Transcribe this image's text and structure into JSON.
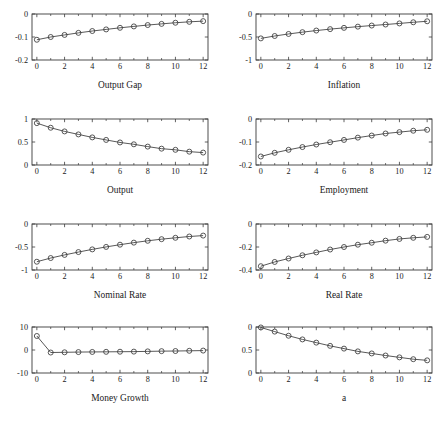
{
  "figure": {
    "rows": 4,
    "cols": 2,
    "background": "#ffffff",
    "line_color": "#3a3a3a",
    "marker": "circle"
  },
  "chart_data": [
    {
      "type": "line",
      "title": "Output Gap",
      "xlabel": "",
      "ylabel": "",
      "x": [
        0,
        1,
        2,
        3,
        4,
        5,
        6,
        7,
        8,
        9,
        10,
        11,
        12
      ],
      "values": [
        -0.112,
        -0.1,
        -0.091,
        -0.082,
        -0.074,
        -0.067,
        -0.06,
        -0.054,
        -0.048,
        -0.043,
        -0.038,
        -0.034,
        -0.031
      ],
      "xlim": [
        -0.35,
        12.35
      ],
      "ylim": [
        -0.2,
        0
      ],
      "xticks": [
        0,
        2,
        4,
        6,
        8,
        10,
        12
      ],
      "xticklabels": [
        "0",
        "2",
        "4",
        "6",
        "8",
        "10",
        "12"
      ],
      "yticks": [
        0,
        -0.1,
        -0.2
      ],
      "yticklabels": [
        "0",
        "-0.1",
        "-0.2"
      ],
      "grid": false,
      "legend": null
    },
    {
      "type": "line",
      "title": "Inflation",
      "xlabel": "",
      "ylabel": "",
      "x": [
        0,
        1,
        2,
        3,
        4,
        5,
        6,
        7,
        8,
        9,
        10,
        11,
        12
      ],
      "values": [
        -0.53,
        -0.478,
        -0.434,
        -0.395,
        -0.36,
        -0.329,
        -0.301,
        -0.275,
        -0.251,
        -0.229,
        -0.205,
        -0.18,
        -0.158
      ],
      "xlim": [
        -0.35,
        12.35
      ],
      "ylim": [
        -1,
        0
      ],
      "xticks": [
        0,
        2,
        4,
        6,
        8,
        10,
        12
      ],
      "xticklabels": [
        "0",
        "2",
        "4",
        "6",
        "8",
        "10",
        "12"
      ],
      "yticks": [
        0,
        -0.5,
        -1
      ],
      "yticklabels": [
        "0",
        "-0.5",
        "-1"
      ],
      "grid": false,
      "legend": null
    },
    {
      "type": "line",
      "title": "Output",
      "xlabel": "",
      "ylabel": "",
      "x": [
        0,
        1,
        2,
        3,
        4,
        5,
        6,
        7,
        8,
        9,
        10,
        11,
        12
      ],
      "values": [
        0.91,
        0.81,
        0.73,
        0.665,
        0.6,
        0.545,
        0.49,
        0.45,
        0.4,
        0.355,
        0.33,
        0.29,
        0.27
      ],
      "xlim": [
        -0.35,
        12.35
      ],
      "ylim": [
        0,
        1
      ],
      "xticks": [
        0,
        2,
        4,
        6,
        8,
        10,
        12
      ],
      "xticklabels": [
        "0",
        "2",
        "4",
        "6",
        "8",
        "10",
        "12"
      ],
      "yticks": [
        1,
        0.5,
        0
      ],
      "yticklabels": [
        "1",
        "0.5",
        "0"
      ],
      "grid": false,
      "legend": null
    },
    {
      "type": "line",
      "title": "Employment",
      "xlabel": "",
      "ylabel": "",
      "x": [
        0,
        1,
        2,
        3,
        4,
        5,
        6,
        7,
        8,
        9,
        10,
        11,
        12
      ],
      "values": [
        -0.163,
        -0.147,
        -0.134,
        -0.122,
        -0.111,
        -0.101,
        -0.091,
        -0.081,
        -0.072,
        -0.063,
        -0.057,
        -0.051,
        -0.047
      ],
      "xlim": [
        -0.35,
        12.35
      ],
      "ylim": [
        -0.2,
        0
      ],
      "xticks": [
        0,
        2,
        4,
        6,
        8,
        10,
        12
      ],
      "xticklabels": [
        "0",
        "2",
        "4",
        "6",
        "8",
        "10",
        "12"
      ],
      "yticks": [
        0,
        -0.1,
        -0.2
      ],
      "yticklabels": [
        "0",
        "-0.1",
        "-0.2"
      ],
      "grid": false,
      "legend": null
    },
    {
      "type": "line",
      "title": "Nominal Rate",
      "xlabel": "",
      "ylabel": "",
      "x": [
        0,
        1,
        2,
        3,
        4,
        5,
        6,
        7,
        8,
        9,
        10,
        11,
        12
      ],
      "values": [
        -0.82,
        -0.74,
        -0.672,
        -0.61,
        -0.552,
        -0.498,
        -0.45,
        -0.405,
        -0.365,
        -0.33,
        -0.3,
        -0.272,
        -0.252
      ],
      "xlim": [
        -0.35,
        12.35
      ],
      "ylim": [
        -1,
        0
      ],
      "xticks": [
        0,
        2,
        4,
        6,
        8,
        10,
        12
      ],
      "xticklabels": [
        "0",
        "2",
        "4",
        "6",
        "8",
        "10",
        "12"
      ],
      "yticks": [
        0,
        -0.5,
        -1
      ],
      "yticklabels": [
        "0",
        "-0.5",
        "-1"
      ],
      "grid": false,
      "legend": null
    },
    {
      "type": "line",
      "title": "Real Rate",
      "xlabel": "",
      "ylabel": "",
      "x": [
        0,
        1,
        2,
        3,
        4,
        5,
        6,
        7,
        8,
        9,
        10,
        11,
        12
      ],
      "values": [
        -0.367,
        -0.33,
        -0.3,
        -0.272,
        -0.247,
        -0.222,
        -0.2,
        -0.18,
        -0.163,
        -0.145,
        -0.13,
        -0.12,
        -0.112
      ],
      "xlim": [
        -0.35,
        12.35
      ],
      "ylim": [
        -0.4,
        0
      ],
      "xticks": [
        0,
        2,
        4,
        6,
        8,
        10,
        12
      ],
      "xticklabels": [
        "0",
        "2",
        "4",
        "6",
        "8",
        "10",
        "12"
      ],
      "yticks": [
        0,
        -0.2,
        -0.4
      ],
      "yticklabels": [
        "0",
        "-0.2",
        "-0.4"
      ],
      "grid": false,
      "legend": null
    },
    {
      "type": "line",
      "title": "Money Growth",
      "xlabel": "",
      "ylabel": "",
      "x": [
        0,
        1,
        2,
        3,
        4,
        5,
        6,
        7,
        8,
        9,
        10,
        11,
        12
      ],
      "values": [
        6.1,
        -1.1,
        -1.0,
        -0.9,
        -0.85,
        -0.8,
        -0.75,
        -0.7,
        -0.6,
        -0.5,
        -0.45,
        -0.35,
        -0.25
      ],
      "xlim": [
        -0.35,
        12.35
      ],
      "ylim": [
        -10,
        10
      ],
      "xticks": [
        0,
        2,
        4,
        6,
        8,
        10,
        12
      ],
      "xticklabels": [
        "0",
        "2",
        "4",
        "6",
        "8",
        "10",
        "12"
      ],
      "yticks": [
        10,
        0,
        -10
      ],
      "yticklabels": [
        "10",
        "0",
        "-10"
      ],
      "grid": false,
      "legend": null
    },
    {
      "type": "line",
      "title": "a",
      "xlabel": "",
      "ylabel": "",
      "x": [
        0,
        1,
        2,
        3,
        4,
        5,
        6,
        7,
        8,
        9,
        10,
        11,
        12
      ],
      "values": [
        0.99,
        0.9,
        0.81,
        0.73,
        0.66,
        0.59,
        0.53,
        0.47,
        0.425,
        0.38,
        0.34,
        0.3,
        0.275
      ],
      "xlim": [
        -0.35,
        12.35
      ],
      "ylim": [
        0,
        1
      ],
      "xticks": [
        0,
        2,
        4,
        6,
        8,
        10,
        12
      ],
      "xticklabels": [
        "0",
        "2",
        "4",
        "6",
        "8",
        "10",
        "12"
      ],
      "yticks": [
        1,
        0.5,
        0
      ],
      "yticklabels": [
        "0",
        "0.5",
        "0"
      ],
      "grid": false,
      "legend": null
    }
  ]
}
